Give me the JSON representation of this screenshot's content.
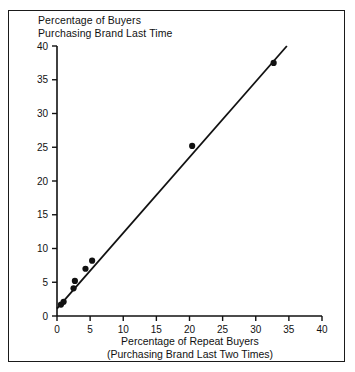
{
  "figure": {
    "title_line1": "Percentage of Buyers",
    "title_line2": "Purchasing Brand Last Time",
    "border_color": "#1a1a1a",
    "background_color": "#ffffff",
    "ink_color": "#111111"
  },
  "chart_data": {
    "type": "scatter",
    "title": "Percentage of Buyers Purchasing Brand Last Time",
    "xlabel": "Percentage of Repeat Buyers",
    "xlabel_line2": "(Purchasing Brand Last Two Times)",
    "ylabel": "Percentage of Buyers Purchasing Brand Last Time",
    "xlim": [
      0,
      40
    ],
    "ylim": [
      0,
      40
    ],
    "xticks": [
      0,
      5,
      10,
      15,
      20,
      25,
      30,
      35,
      40
    ],
    "yticks": [
      0,
      5,
      10,
      15,
      20,
      25,
      30,
      35,
      40
    ],
    "xtick_labels": [
      "0",
      "5",
      "10",
      "15",
      "20",
      "25",
      "30",
      "35",
      "40"
    ],
    "ytick_labels": [
      "0",
      "5",
      "10",
      "15",
      "20",
      "25",
      "30",
      "35",
      "40"
    ],
    "grid": false,
    "legend": false,
    "marker_style": "filled-circle",
    "marker_color": "#111111",
    "marker_radius": 3.1,
    "points": [
      {
        "x": 0.6,
        "y": 1.7
      },
      {
        "x": 1.0,
        "y": 2.1
      },
      {
        "x": 2.5,
        "y": 4.1
      },
      {
        "x": 2.7,
        "y": 5.2
      },
      {
        "x": 4.3,
        "y": 7.0
      },
      {
        "x": 5.3,
        "y": 8.2
      },
      {
        "x": 20.4,
        "y": 25.2
      },
      {
        "x": 32.7,
        "y": 37.5
      }
    ],
    "fit_line": {
      "type": "linear-fit",
      "x_start": 0.0,
      "y_start": 1.1,
      "x_end": 34.7,
      "y_end": 40.0,
      "color": "#111111",
      "width": 1.8
    }
  }
}
